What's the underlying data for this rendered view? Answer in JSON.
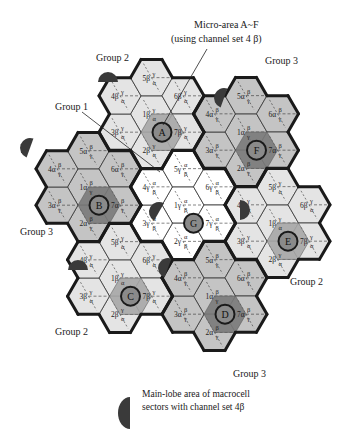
{
  "annotations": {
    "micro_area_title": "Micro-area A~F",
    "micro_area_subtitle": "(using channel set 4 β)",
    "group_1": "Group 1"
  },
  "colors": {
    "group1_fill": "#ffffff",
    "group2_fill": "#e4e4e4",
    "group3_fill": "#c4c4c4",
    "micro_fill_light": "#a8a8a8",
    "micro_fill_dark": "#7a7a7a",
    "lobe_fill": "#3a3a3a",
    "border": "#1a1a1a"
  },
  "clusters": [
    {
      "id": "G",
      "group": "Group 1",
      "group_label": "",
      "cx": 183,
      "cy": 205,
      "circle": "G",
      "cells": [
        "1γ α/β",
        "2γ α/β",
        "3γ α/β",
        "4γ α/β",
        "5γ α/β",
        "6γ α/β",
        "7γ α/β"
      ],
      "sup": "α",
      "sub": "β",
      "pre": "γ"
    },
    {
      "id": "A",
      "group": "Group 2",
      "group_label": "Group 2",
      "cx": 151.5,
      "cy": 114,
      "circle": "A",
      "sup": "γ",
      "sub": "α",
      "pre": "β"
    },
    {
      "id": "F",
      "group": "Group 3",
      "group_label": "Group 3",
      "cx": 246,
      "cy": 132,
      "circle": "F",
      "sup": "β",
      "sub": "γ",
      "pre": "α"
    },
    {
      "id": "E",
      "group": "Group 2",
      "group_label": "Group 2",
      "cx": 277.5,
      "cy": 223,
      "circle": "E",
      "sup": "γ",
      "sub": "α",
      "pre": "β"
    },
    {
      "id": "D",
      "group": "Group 3",
      "group_label": "Group 3",
      "cx": 214.5,
      "cy": 296,
      "circle": "D",
      "sup": "β",
      "sub": "γ",
      "pre": "α"
    },
    {
      "id": "C",
      "group": "Group 2",
      "group_label": "Group 2",
      "cx": 120,
      "cy": 278,
      "circle": "C",
      "sup": "γ",
      "sub": "α",
      "pre": "β"
    },
    {
      "id": "B",
      "group": "Group 3",
      "group_label": "Group 3",
      "cx": 88.5,
      "cy": 187,
      "circle": "B",
      "sup": "β",
      "sub": "γ",
      "pre": "α"
    }
  ],
  "group_labels": [
    {
      "text": "Group 2",
      "x": 96,
      "y": 52
    },
    {
      "text": "Group 3",
      "x": 265,
      "y": 55
    },
    {
      "text": "Group 1",
      "x": 55,
      "y": 101
    },
    {
      "text": "Group 3",
      "x": 20,
      "y": 226
    },
    {
      "text": "Group 2",
      "x": 290,
      "y": 276
    },
    {
      "text": "Group 2",
      "x": 55,
      "y": 326
    },
    {
      "text": "Group 3",
      "x": 233,
      "y": 368
    }
  ],
  "legend": {
    "line1": "Main-lobe area of macrocell",
    "line2": "sectors with channel set 4β"
  }
}
